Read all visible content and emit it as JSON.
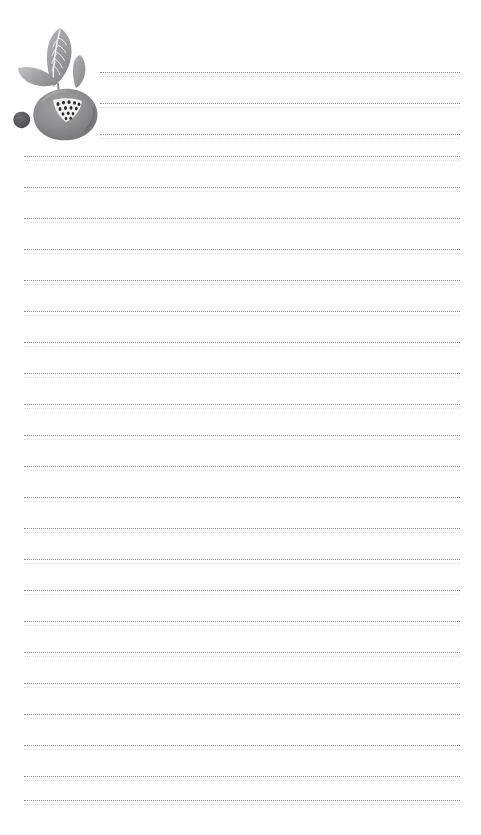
{
  "page": {
    "kind": "lined-notepaper",
    "width": 481,
    "height": 835,
    "background_color": "#ffffff",
    "title": "",
    "header_text": "",
    "footer_text": ""
  },
  "illustration": {
    "name": "fruit-illustration",
    "subject": "pomegranate with leaves and berry",
    "alt_text": "Watercolor grey pomegranate with two leaves and a small berry",
    "position": "top-left",
    "colors": {
      "fruit_fill": "#8e8d8f",
      "fruit_shadow": "#6f6e71",
      "leaf_fill": "#9a9a9c",
      "leaf_light": "#b4b4b6",
      "leaf_vein": "#efefef",
      "berry_fill": "#59585b",
      "seed_patch": "#f2f2f0",
      "seed_dot": "#2b2a2d"
    },
    "parts": [
      {
        "name": "large-leaf",
        "label": "Large veined leaf"
      },
      {
        "name": "small-leaf",
        "label": "Small upright leaf"
      },
      {
        "name": "side-leaf",
        "label": "Left side leaf"
      },
      {
        "name": "fruit-body",
        "label": "Pomegranate body"
      },
      {
        "name": "seed-patch",
        "label": "Cut seed patch"
      },
      {
        "name": "small-berry",
        "label": "Loose berry"
      }
    ]
  },
  "rules": {
    "line_color": "#8d8d93",
    "line_style": "dotted",
    "line_spacing_px": 31,
    "first_line_y": 72,
    "indent_left_px": 100,
    "full_left_px": 24,
    "right_px": 21,
    "indented_count": 3,
    "total_count": 24,
    "lines": [
      {
        "index": 1,
        "y": 72,
        "indented": true,
        "text": ""
      },
      {
        "index": 2,
        "y": 103,
        "indented": true,
        "text": ""
      },
      {
        "index": 3,
        "y": 134,
        "indented": true,
        "text": ""
      },
      {
        "index": 4,
        "y": 156,
        "indented": false,
        "text": ""
      },
      {
        "index": 5,
        "y": 187,
        "indented": false,
        "text": ""
      },
      {
        "index": 6,
        "y": 218,
        "indented": false,
        "text": ""
      },
      {
        "index": 7,
        "y": 249,
        "indented": false,
        "text": ""
      },
      {
        "index": 8,
        "y": 280,
        "indented": false,
        "text": ""
      },
      {
        "index": 9,
        "y": 311,
        "indented": false,
        "text": ""
      },
      {
        "index": 10,
        "y": 342,
        "indented": false,
        "text": ""
      },
      {
        "index": 11,
        "y": 373,
        "indented": false,
        "text": ""
      },
      {
        "index": 12,
        "y": 404,
        "indented": false,
        "text": ""
      },
      {
        "index": 13,
        "y": 435,
        "indented": false,
        "text": ""
      },
      {
        "index": 14,
        "y": 466,
        "indented": false,
        "text": ""
      },
      {
        "index": 15,
        "y": 497,
        "indented": false,
        "text": ""
      },
      {
        "index": 16,
        "y": 528,
        "indented": false,
        "text": ""
      },
      {
        "index": 17,
        "y": 559,
        "indented": false,
        "text": ""
      },
      {
        "index": 18,
        "y": 590,
        "indented": false,
        "text": ""
      },
      {
        "index": 19,
        "y": 621,
        "indented": false,
        "text": ""
      },
      {
        "index": 20,
        "y": 652,
        "indented": false,
        "text": ""
      },
      {
        "index": 21,
        "y": 683,
        "indented": false,
        "text": ""
      },
      {
        "index": 22,
        "y": 714,
        "indented": false,
        "text": ""
      },
      {
        "index": 23,
        "y": 745,
        "indented": false,
        "text": ""
      },
      {
        "index": 24,
        "y": 776,
        "indented": false,
        "text": ""
      },
      {
        "index": 25,
        "y": 800,
        "indented": false,
        "text": ""
      }
    ]
  }
}
